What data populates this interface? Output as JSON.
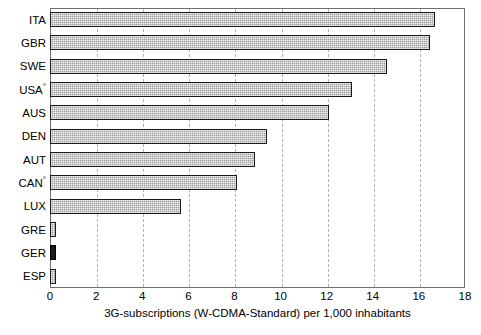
{
  "chart_data": {
    "type": "bar",
    "orientation": "horizontal",
    "title": "",
    "subtitle": "",
    "xlabel": "3G-subscriptions (W-CDMA-Standard) per 1,000 inhabitants",
    "ylabel": "",
    "categories": [
      "ITA",
      "GBR",
      "SWE",
      "USA°",
      "AUS",
      "DEN",
      "AUT",
      "CAN°",
      "LUX",
      "GRE",
      "GER",
      "ESP"
    ],
    "values": [
      16.7,
      16.5,
      14.6,
      13.1,
      12.1,
      9.4,
      8.9,
      8.1,
      5.7,
      0.25,
      0.25,
      0.25
    ],
    "xlim": [
      0,
      18
    ],
    "xticks": [
      0,
      2,
      4,
      6,
      8,
      10,
      12,
      14,
      16,
      18
    ],
    "xtick_labels": [
      "0",
      "2",
      "4",
      "6",
      "8",
      "10",
      "12",
      "14",
      "16",
      "18"
    ],
    "grid": "vertical-dashed",
    "legend": "none",
    "series": [
      {
        "name": "3G-subscriptions per 1,000 inhabitants",
        "values": [
          16.7,
          16.5,
          14.6,
          13.1,
          12.1,
          9.4,
          8.9,
          8.1,
          5.7,
          0.25,
          0.25,
          0.25
        ]
      }
    ],
    "bars": [
      {
        "category": "ITA",
        "value": 16.7,
        "style": "hatched-gray"
      },
      {
        "category": "GBR",
        "value": 16.5,
        "style": "hatched-gray"
      },
      {
        "category": "SWE",
        "value": 14.6,
        "style": "hatched-gray"
      },
      {
        "category": "USA°",
        "value": 13.1,
        "style": "hatched-gray"
      },
      {
        "category": "AUS",
        "value": 12.1,
        "style": "hatched-gray"
      },
      {
        "category": "DEN",
        "value": 9.4,
        "style": "hatched-gray"
      },
      {
        "category": "AUT",
        "value": 8.9,
        "style": "hatched-gray"
      },
      {
        "category": "CAN°",
        "value": 8.1,
        "style": "hatched-gray"
      },
      {
        "category": "LUX",
        "value": 5.7,
        "style": "hatched-gray"
      },
      {
        "category": "GRE",
        "value": 0.25,
        "style": "hatched-gray"
      },
      {
        "category": "GER",
        "value": 0.25,
        "style": "solid-dark"
      },
      {
        "category": "ESP",
        "value": 0.25,
        "style": "hatched-gray"
      }
    ],
    "colors": {
      "bar_fill": "#9d9d9d",
      "bar_fill_dark": "#1b1b1b",
      "bar_border": "#1a1a1a",
      "gridline": "#b5b5b5",
      "frame": "#6f6f6f",
      "background": "#ffffff",
      "text": "#000000"
    },
    "footnote_markers": [
      "USA°",
      "CAN°"
    ]
  }
}
